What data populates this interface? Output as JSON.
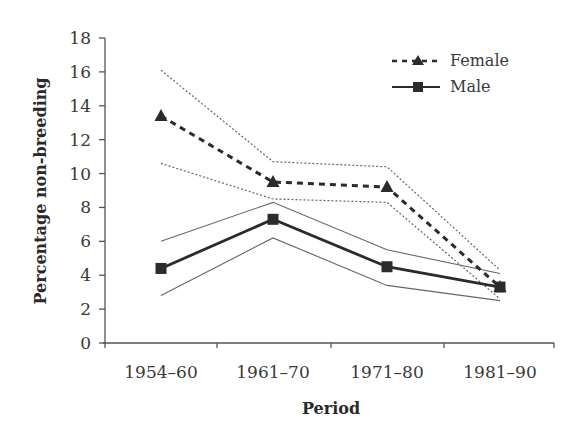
{
  "chart_data": {
    "type": "line",
    "title": "",
    "xlabel": "Period",
    "ylabel": "Percentage non-breeding",
    "categories": [
      "1954–60",
      "1961–70",
      "1971–80",
      "1981–90"
    ],
    "ylim": [
      0,
      18
    ],
    "yticks": [
      0,
      2,
      4,
      6,
      8,
      10,
      12,
      14,
      16,
      18
    ],
    "grid": false,
    "legend_position": "upper right",
    "series": [
      {
        "name": "Female",
        "marker": "triangle",
        "line_style": "dashed",
        "values": [
          13.4,
          9.5,
          9.2,
          3.3
        ],
        "upper_ci": [
          16.1,
          10.7,
          10.4,
          4.3
        ],
        "lower_ci": [
          10.6,
          8.5,
          8.3,
          2.6
        ]
      },
      {
        "name": "Male",
        "marker": "square",
        "line_style": "solid",
        "values": [
          4.4,
          7.3,
          4.5,
          3.3
        ],
        "upper_ci": [
          6.0,
          8.3,
          5.5,
          4.1
        ],
        "lower_ci": [
          2.8,
          6.2,
          3.4,
          2.5
        ]
      }
    ]
  },
  "colors": {
    "axis": "#555555",
    "series": "#2b2b2b",
    "ci": "#666666"
  }
}
